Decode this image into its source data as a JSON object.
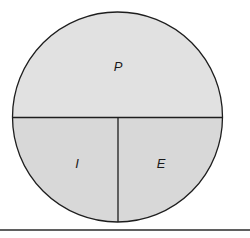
{
  "diagram": {
    "type": "partitioned-circle",
    "regions": [
      {
        "id": "top",
        "label": "P",
        "fill": "#e1e1e1"
      },
      {
        "id": "bottom-left",
        "label": "I",
        "fill": "#d8d8d8"
      },
      {
        "id": "bottom-right",
        "label": "E",
        "fill": "#d8d8d8"
      }
    ],
    "stroke": "#1e1e1e",
    "baseline_color": "#2a2a2a"
  }
}
